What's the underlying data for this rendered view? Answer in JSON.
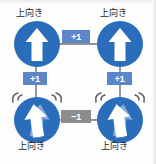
{
  "diagram": {
    "type": "graph",
    "title": "",
    "colors": {
      "node_fill": "#2a6ebb",
      "node_arrow": "#ffffff",
      "edge_line": "#6e6e6e",
      "badge_positive": "#5b87c8",
      "badge_negative": "#8d8d8d",
      "background": "#fdfdfd"
    },
    "nodes": [
      {
        "id": "top-left",
        "label": "上向き",
        "label_position": "above",
        "icon": "up-arrow-in-circle-icon",
        "state": "steady",
        "cx": 37,
        "cy": 44,
        "r": 23
      },
      {
        "id": "top-right",
        "label": "上向き",
        "label_position": "above",
        "icon": "up-arrow-in-circle-icon",
        "state": "steady",
        "cx": 120,
        "cy": 44,
        "r": 23
      },
      {
        "id": "bottom-left",
        "label": "上向き",
        "label_position": "below",
        "icon": "up-arrow-in-circle-shaking-icon",
        "state": "shaking",
        "cx": 37,
        "cy": 120,
        "r": 23
      },
      {
        "id": "bottom-right",
        "label": "上向き",
        "label_position": "below",
        "icon": "up-arrow-in-circle-shaking-icon",
        "state": "shaking",
        "cx": 120,
        "cy": 120,
        "r": 23
      }
    ],
    "edges": [
      {
        "id": "edge-top",
        "from": "top-left",
        "to": "top-right",
        "weight": "+1",
        "weight_sign": "positive",
        "orientation": "horizontal"
      },
      {
        "id": "edge-left",
        "from": "top-left",
        "to": "bottom-left",
        "weight": "+1",
        "weight_sign": "positive",
        "orientation": "vertical"
      },
      {
        "id": "edge-right",
        "from": "top-right",
        "to": "bottom-right",
        "weight": "+1",
        "weight_sign": "positive",
        "orientation": "vertical"
      },
      {
        "id": "edge-bottom",
        "from": "bottom-left",
        "to": "bottom-right",
        "weight": "−1",
        "weight_sign": "negative",
        "orientation": "horizontal"
      }
    ]
  }
}
